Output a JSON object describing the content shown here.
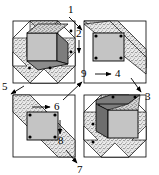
{
  "figure": {
    "type": "quilt-block-assembly-diagram",
    "background_color": "#ffffff",
    "line_color": "#000000",
    "colors": {
      "light_gray": "#c9c9c9",
      "mid_gray": "#a8a8a8",
      "dark_gray": "#808080",
      "darker_gray": "#6e6e6e",
      "stipple": "#d6d6d6",
      "white": "#ffffff",
      "dot": "#000000"
    }
  },
  "labels": [
    {
      "id": "1",
      "text": "1",
      "x": 70,
      "y": 9,
      "arrow": "down-right"
    },
    {
      "id": "2",
      "text": "2",
      "x": 79,
      "y": 32,
      "arrow": "down"
    },
    {
      "id": "3",
      "text": "3",
      "x": 140,
      "y": 88,
      "arrow": "down-right"
    },
    {
      "id": "4",
      "text": "4",
      "x": 114,
      "y": 73,
      "arrow": "right"
    },
    {
      "id": "5",
      "text": "5",
      "x": 3,
      "y": 89,
      "arrow": "down-left"
    },
    {
      "id": "6",
      "text": "6",
      "x": 53,
      "y": 103,
      "arrow": "right"
    },
    {
      "id": "7",
      "text": "7",
      "x": 74,
      "y": 163,
      "arrow": "down-right"
    },
    {
      "id": "8",
      "text": "8",
      "x": 57,
      "y": 138,
      "arrow": "down"
    },
    {
      "id": "9",
      "text": "9",
      "x": 82,
      "y": 73,
      "arrow": "up-right"
    }
  ],
  "panels": [
    {
      "name": "top-left-block",
      "content": "tumbling-block cube with stippled star surround",
      "dot_count": 4
    },
    {
      "name": "top-right-block",
      "content": "flat square unit with stippled diagonal band",
      "dot_count": 4
    },
    {
      "name": "bottom-left-block",
      "content": "flat square unit with stippled diagonal band",
      "dot_count": 4
    },
    {
      "name": "bottom-right-block",
      "content": "tumbling-block cube with stippled star surround",
      "dot_count": 4
    }
  ]
}
